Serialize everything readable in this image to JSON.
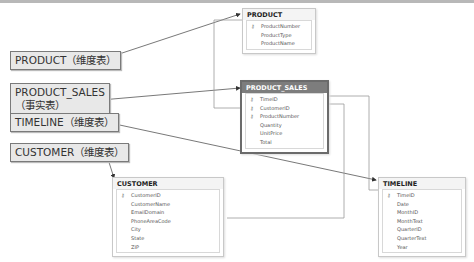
{
  "labels": [
    {
      "id": "product",
      "text": "PRODUCT（维度表）"
    },
    {
      "id": "product_sales",
      "text": "PRODUCT_SALES\n（事实表）"
    },
    {
      "id": "timeline",
      "text": "TIMELINE（维度表）"
    },
    {
      "id": "customer",
      "text": "CUSTOMER（维度表）"
    }
  ],
  "tables": {
    "product": {
      "title": "PRODUCT",
      "columns": [
        {
          "name": "ProductNumber",
          "key": true
        },
        {
          "name": "ProductType",
          "key": false
        },
        {
          "name": "ProductName",
          "key": false
        }
      ]
    },
    "product_sales": {
      "title": "PRODUCT_SALES",
      "columns": [
        {
          "name": "TimeID",
          "key": true
        },
        {
          "name": "CustomerID",
          "key": true
        },
        {
          "name": "ProductNumber",
          "key": true
        },
        {
          "name": "Quantity",
          "key": false
        },
        {
          "name": "UnitPrice",
          "key": false
        },
        {
          "name": "Total",
          "key": false
        }
      ]
    },
    "customer": {
      "title": "CUSTOMER",
      "columns": [
        {
          "name": "CustomerID",
          "key": true
        },
        {
          "name": "CustomerName",
          "key": false
        },
        {
          "name": "EmailDomain",
          "key": false
        },
        {
          "name": "PhoneAreaCode",
          "key": false
        },
        {
          "name": "City",
          "key": false
        },
        {
          "name": "State",
          "key": false
        },
        {
          "name": "ZIP",
          "key": false
        }
      ]
    },
    "timeline": {
      "title": "TIMELINE",
      "columns": [
        {
          "name": "TimeID",
          "key": true
        },
        {
          "name": "Date",
          "key": false
        },
        {
          "name": "MonthID",
          "key": false
        },
        {
          "name": "MonthText",
          "key": false
        },
        {
          "name": "QuarterID",
          "key": false
        },
        {
          "name": "QuarterText",
          "key": false
        },
        {
          "name": "Year",
          "key": false
        }
      ]
    }
  },
  "icons": {
    "key": "⚷"
  }
}
